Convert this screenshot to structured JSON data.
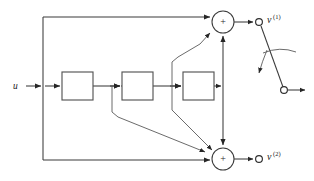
{
  "figure": {
    "type": "block-diagram",
    "domain": "signal-flow / control-system",
    "background_color": "#ffffff",
    "line_color": "#3b3b3b",
    "block_stroke_color": "#555555",
    "width": 314,
    "height": 181
  },
  "labels": {
    "input": "u",
    "output_top_base": "v",
    "output_top_sup": "(1)",
    "output_bottom_base": "v",
    "output_bottom_sup": "(2)",
    "summer_top_sign": "+",
    "summer_bottom_sign": "+"
  },
  "blocks": [
    {
      "id": "block-1",
      "label": "",
      "x": 62,
      "y": 72,
      "w": 31,
      "h": 28
    },
    {
      "id": "block-2",
      "label": "",
      "x": 122,
      "y": 72,
      "w": 31,
      "h": 28
    },
    {
      "id": "block-3",
      "label": "",
      "x": 183,
      "y": 72,
      "w": 31,
      "h": 28
    }
  ],
  "nodes": [
    {
      "id": "summer-top",
      "kind": "summing-junction",
      "cx": 223,
      "cy": 22,
      "r": 11,
      "sign": "+"
    },
    {
      "id": "summer-bottom",
      "kind": "summing-junction",
      "cx": 223,
      "cy": 159,
      "r": 11,
      "sign": "+"
    },
    {
      "id": "terminal-v1",
      "kind": "open-terminal",
      "cx": 259,
      "cy": 22,
      "r": 3.4
    },
    {
      "id": "terminal-v2",
      "kind": "open-terminal",
      "cx": 259,
      "cy": 159,
      "r": 3.4
    },
    {
      "id": "switch-pole",
      "kind": "open-terminal",
      "cx": 284,
      "cy": 90,
      "r": 3.4
    }
  ],
  "switch": {
    "id": "changeover-switch",
    "description": "switch blade from v(1) terminal to lower pole with curved actuation arrow",
    "blade_from": [
      261,
      26
    ],
    "blade_to": [
      282,
      87
    ],
    "arc_present": true,
    "arrow_present": true
  },
  "connections": [
    {
      "id": "input-to-branch",
      "from": "u",
      "to": "branch-left"
    },
    {
      "id": "branch-to-block1",
      "from": "branch-left",
      "to": "block-1"
    },
    {
      "id": "block1-to-block2",
      "from": "block-1",
      "to": "block-2"
    },
    {
      "id": "block2-to-block3",
      "from": "block-2",
      "to": "block-3"
    },
    {
      "id": "block3-to-vertical",
      "from": "block-3",
      "to": "right-vertical-bus"
    },
    {
      "id": "bus-to-summer-top",
      "from": "right-vertical-bus",
      "to": "summer-top"
    },
    {
      "id": "bus-to-summer-bottom",
      "from": "right-vertical-bus",
      "to": "summer-bottom"
    },
    {
      "id": "feedthrough-top",
      "from": "branch-left",
      "to": "summer-top"
    },
    {
      "id": "feedthrough-bottom",
      "from": "branch-left",
      "to": "summer-bottom"
    },
    {
      "id": "tap1-to-summer-bottom",
      "from": "tap-after-block1",
      "to": "summer-bottom"
    },
    {
      "id": "tap2-to-summer-top",
      "from": "tap-after-block2",
      "to": "summer-top"
    },
    {
      "id": "tap2-to-summer-bottom",
      "from": "tap-after-block2",
      "to": "summer-bottom"
    },
    {
      "id": "summer-top-to-v1",
      "from": "summer-top",
      "to": "terminal-v1"
    },
    {
      "id": "summer-bottom-to-v2",
      "from": "summer-bottom",
      "to": "terminal-v2"
    },
    {
      "id": "switch-pole-out",
      "from": "switch-pole",
      "to": "output-arrow"
    }
  ]
}
